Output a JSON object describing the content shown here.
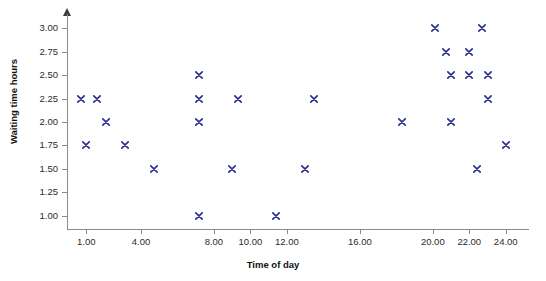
{
  "chart_data": {
    "type": "scatter",
    "title": "",
    "xlabel": "Time of day",
    "ylabel": "Waiting time hours",
    "xlim": [
      0.0,
      25.0
    ],
    "ylim": [
      3.15,
      0.85
    ],
    "y_inverted": true,
    "grid": false,
    "legend": null,
    "marker_symbol": "x",
    "marker_color": "#2e3191",
    "axis_color": "#8a8a8a",
    "xticks": [
      {
        "value": 1.0,
        "label": "1.00"
      },
      {
        "value": 4.0,
        "label": "4.00"
      },
      {
        "value": 8.0,
        "label": "8.00"
      },
      {
        "value": 10.0,
        "label": "10.00"
      },
      {
        "value": 12.0,
        "label": "12.00"
      },
      {
        "value": 16.0,
        "label": "16.00"
      },
      {
        "value": 20.0,
        "label": "20.00"
      },
      {
        "value": 22.0,
        "label": "22.00"
      },
      {
        "value": 24.0,
        "label": "24.00"
      }
    ],
    "yticks": [
      {
        "value": 1.0,
        "label": "1.00"
      },
      {
        "value": 1.25,
        "label": "1.25"
      },
      {
        "value": 1.5,
        "label": "1.50"
      },
      {
        "value": 1.75,
        "label": "1.75"
      },
      {
        "value": 2.0,
        "label": "2.00"
      },
      {
        "value": 2.25,
        "label": "2.25"
      },
      {
        "value": 2.5,
        "label": "2.50"
      },
      {
        "value": 2.75,
        "label": "2.75"
      },
      {
        "value": 3.0,
        "label": "3.00"
      }
    ],
    "points": [
      {
        "x": 0.7,
        "y": 2.25
      },
      {
        "x": 1.0,
        "y": 1.75
      },
      {
        "x": 1.6,
        "y": 2.25
      },
      {
        "x": 2.1,
        "y": 2.0
      },
      {
        "x": 3.1,
        "y": 1.75
      },
      {
        "x": 4.7,
        "y": 1.5
      },
      {
        "x": 7.2,
        "y": 1.0
      },
      {
        "x": 7.2,
        "y": 2.0
      },
      {
        "x": 7.2,
        "y": 2.25
      },
      {
        "x": 7.2,
        "y": 2.5
      },
      {
        "x": 9.0,
        "y": 1.5
      },
      {
        "x": 9.3,
        "y": 2.25
      },
      {
        "x": 11.4,
        "y": 1.0
      },
      {
        "x": 13.0,
        "y": 1.5
      },
      {
        "x": 13.5,
        "y": 2.25
      },
      {
        "x": 18.3,
        "y": 2.0
      },
      {
        "x": 20.1,
        "y": 3.0
      },
      {
        "x": 20.7,
        "y": 2.75
      },
      {
        "x": 21.0,
        "y": 2.5
      },
      {
        "x": 21.0,
        "y": 2.0
      },
      {
        "x": 22.0,
        "y": 2.5
      },
      {
        "x": 22.0,
        "y": 2.75
      },
      {
        "x": 22.4,
        "y": 1.5
      },
      {
        "x": 22.7,
        "y": 3.0
      },
      {
        "x": 23.0,
        "y": 2.25
      },
      {
        "x": 23.0,
        "y": 2.5
      },
      {
        "x": 24.0,
        "y": 1.75
      }
    ]
  }
}
